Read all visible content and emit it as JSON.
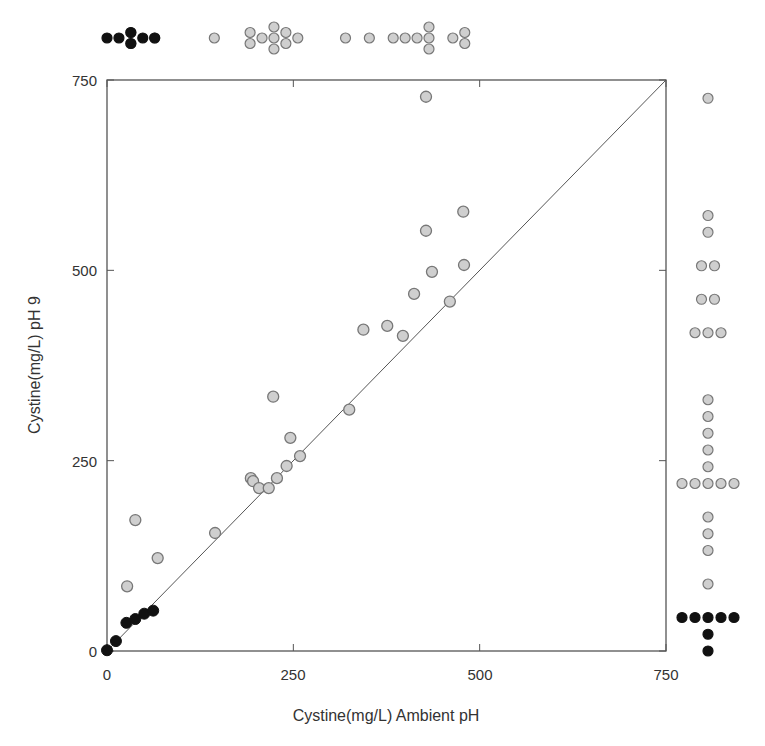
{
  "chart_data": {
    "type": "scatter",
    "title": "",
    "xlabel": "Cystine(mg/L) Ambient pH",
    "ylabel": "Cystine(mg/L) pH 9",
    "xlim": [
      0,
      750
    ],
    "ylim": [
      0,
      750
    ],
    "xticks": [
      0,
      250,
      500,
      750
    ],
    "yticks": [
      0,
      250,
      500,
      750
    ],
    "grid": false,
    "legend": null,
    "reference_line": {
      "type": "identity",
      "from": [
        0,
        0
      ],
      "to": [
        750,
        750
      ]
    },
    "colors": {
      "filled": "#111111",
      "gray_fill": "#cfcfcf",
      "gray_edge": "#777777",
      "axis": "#555555"
    },
    "series": [
      {
        "name": "low (filled black)",
        "points": [
          [
            0,
            1
          ],
          [
            12,
            13
          ],
          [
            26,
            37
          ],
          [
            38,
            42
          ],
          [
            50,
            49
          ],
          [
            62,
            53
          ]
        ]
      },
      {
        "name": "high (gray)",
        "points": [
          [
            27,
            85
          ],
          [
            38,
            172
          ],
          [
            68,
            122
          ],
          [
            145,
            155
          ],
          [
            193,
            227
          ],
          [
            196,
            223
          ],
          [
            204,
            214
          ],
          [
            217,
            214
          ],
          [
            228,
            227
          ],
          [
            241,
            243
          ],
          [
            246,
            280
          ],
          [
            259,
            256
          ],
          [
            223,
            334
          ],
          [
            325,
            317
          ],
          [
            344,
            422
          ],
          [
            376,
            427
          ],
          [
            397,
            414
          ],
          [
            412,
            469
          ],
          [
            436,
            498
          ],
          [
            460,
            459
          ],
          [
            428,
            552
          ],
          [
            479,
            507
          ],
          [
            478,
            577
          ],
          [
            428,
            728
          ]
        ]
      }
    ],
    "marginal_top": {
      "description": "dot plot of x values above the plot",
      "filled_count": 6,
      "gray_count": 24
    },
    "marginal_right": {
      "description": "dot plot of y values right of the plot",
      "filled_count": 7,
      "gray_count": 24
    }
  },
  "axes": {
    "x_tick_labels": [
      "0",
      "250",
      "500",
      "750"
    ],
    "y_tick_labels": [
      "0",
      "250",
      "500",
      "750"
    ],
    "x_title": "Cystine(mg/L) Ambient pH",
    "y_title": "Cystine(mg/L) pH 9"
  }
}
